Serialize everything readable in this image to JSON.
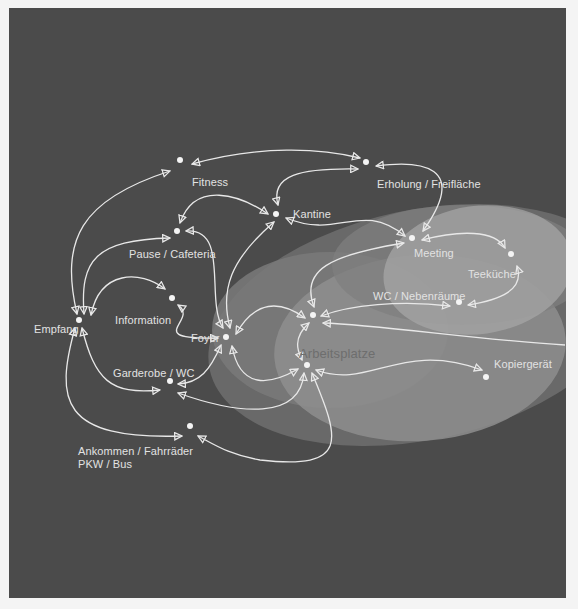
{
  "diagram": {
    "title": "",
    "colors": {
      "background": "#4b4b4b",
      "page": "#f4f4f4",
      "lines": "#e8e8e8",
      "ellipse_outer": "#6d6d6d",
      "ellipse_mid": "#8c8c8c",
      "ellipse_inner": "#a9a9a9"
    },
    "zone_label": "Arbeitsplatze",
    "nodes": [
      {
        "id": "fitness",
        "label": "Fitness",
        "x": 180,
        "y": 160
      },
      {
        "id": "erholung",
        "label": "Erholung / Freifläche",
        "x": 366,
        "y": 162
      },
      {
        "id": "kantine",
        "label": "Kantine",
        "x": 276,
        "y": 214
      },
      {
        "id": "pause",
        "label": "Pause / Cafeteria",
        "x": 177,
        "y": 231
      },
      {
        "id": "meeting",
        "label": "Meeting",
        "x": 412,
        "y": 238
      },
      {
        "id": "teekueche",
        "label": "Teeküche",
        "x": 511,
        "y": 254
      },
      {
        "id": "information",
        "label": "Information",
        "x": 172,
        "y": 298
      },
      {
        "id": "wc_neben",
        "label": "WC / Nebenräume",
        "x": 459,
        "y": 302
      },
      {
        "id": "empfang",
        "label": "Empfang",
        "x": 79,
        "y": 320
      },
      {
        "id": "arbeitsplatz_1",
        "label": "",
        "x": 313,
        "y": 315
      },
      {
        "id": "foyer",
        "label": "Foyer",
        "x": 226,
        "y": 337
      },
      {
        "id": "arbeitsplatz_2",
        "label": "",
        "x": 307,
        "y": 365
      },
      {
        "id": "kopiergeraet",
        "label": "Kopiergerät",
        "x": 486,
        "y": 377
      },
      {
        "id": "garderobe",
        "label": "Garderobe / WC",
        "x": 170,
        "y": 381
      },
      {
        "id": "ankommen",
        "label": "Ankommen / Fahrräder\nPKW / Bus",
        "x": 190,
        "y": 426
      }
    ],
    "labels": {
      "fitness": "Fitness",
      "erholung": "Erholung / Freifläche",
      "kantine": "Kantine",
      "pause": "Pause / Cafeteria",
      "meeting": "Meeting",
      "teekueche": "Teeküche",
      "information": "Information",
      "wc_neben": "WC / Nebenräume",
      "empfang": "Empfang",
      "foyer": "Foyer",
      "kopiergeraet": "Kopiergerät",
      "garderobe": "Garderobe / WC",
      "ankommen_line1": "Ankommen / Fahrräder",
      "ankommen_line2": "PKW / Bus"
    },
    "edges": [
      [
        "empfang",
        "fitness"
      ],
      [
        "empfang",
        "pause"
      ],
      [
        "empfang",
        "information"
      ],
      [
        "empfang",
        "garderobe"
      ],
      [
        "empfang",
        "ankommen"
      ],
      [
        "fitness",
        "erholung"
      ],
      [
        "erholung",
        "kantine"
      ],
      [
        "erholung",
        "meeting"
      ],
      [
        "pause",
        "kantine"
      ],
      [
        "pause",
        "foyer"
      ],
      [
        "kantine",
        "meeting"
      ],
      [
        "kantine",
        "foyer"
      ],
      [
        "information",
        "foyer"
      ],
      [
        "foyer",
        "garderobe"
      ],
      [
        "foyer",
        "arbeitsplatz_1"
      ],
      [
        "foyer",
        "arbeitsplatz_2"
      ],
      [
        "meeting",
        "teekueche"
      ],
      [
        "meeting",
        "arbeitsplatz_1"
      ],
      [
        "teekueche",
        "wc_neben"
      ],
      [
        "wc_neben",
        "arbeitsplatz_1"
      ],
      [
        "arbeitsplatz_1",
        "arbeitsplatz_2"
      ],
      [
        "arbeitsplatz_2",
        "kopiergeraet"
      ],
      [
        "arbeitsplatz_2",
        "garderobe"
      ],
      [
        "arbeitsplatz_2",
        "ankommen"
      ]
    ]
  }
}
